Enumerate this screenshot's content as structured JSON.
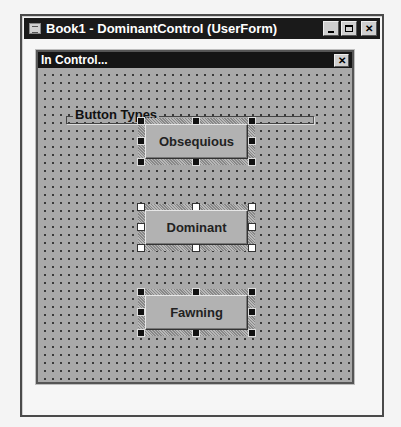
{
  "window": {
    "title": "Book1 - DominantControl (UserForm)",
    "icon": "vba-userform-icon",
    "controls": {
      "minimize": "_",
      "maximize": "□",
      "close": "✕"
    }
  },
  "form": {
    "caption": "In Control...",
    "close": "✕",
    "background": "#a9a9a9"
  },
  "frame": {
    "label": "Button Types"
  },
  "buttons": [
    {
      "label": "Obsequious",
      "selected": true,
      "primary": false
    },
    {
      "label": "Dominant",
      "selected": true,
      "primary": true
    },
    {
      "label": "Fawning",
      "selected": true,
      "primary": false
    }
  ]
}
